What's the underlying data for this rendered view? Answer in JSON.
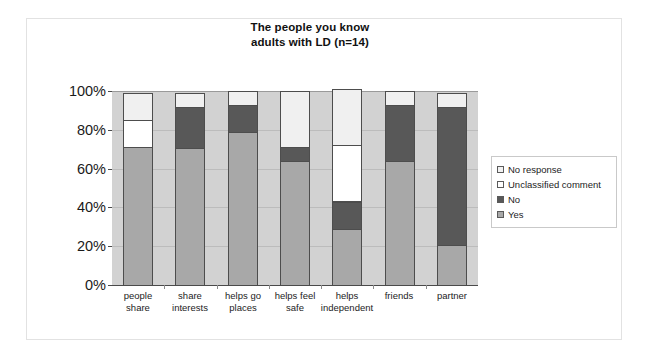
{
  "chart_data": {
    "type": "bar",
    "subtype": "stacked-100-percent",
    "title": "The people you know adults with LD (n=14)",
    "title_lines": [
      "The people you know",
      "adults with LD (n=14)"
    ],
    "xlabel": "",
    "ylabel": "",
    "ylim": [
      0,
      100
    ],
    "ytick_labels": [
      "0%",
      "20%",
      "40%",
      "60%",
      "80%",
      "100%"
    ],
    "ytick_values": [
      0,
      20,
      40,
      60,
      80,
      100
    ],
    "grid": true,
    "legend_position": "right",
    "categories": [
      "people share",
      "share interests",
      "helps go places",
      "helps feel safe",
      "helps independent",
      "friends",
      "partner"
    ],
    "category_lines": [
      [
        "people",
        "share"
      ],
      [
        "share",
        "interests"
      ],
      [
        "helps go",
        "places"
      ],
      [
        "helps feel",
        "safe"
      ],
      [
        "helps",
        "independent"
      ],
      [
        "friends",
        ""
      ],
      [
        "partner",
        ""
      ]
    ],
    "series": [
      {
        "name": "Yes",
        "color": "#a8a8a8",
        "values": [
          71,
          71,
          79,
          64,
          29,
          64,
          21
        ]
      },
      {
        "name": "No",
        "color": "#585858",
        "values": [
          0,
          21,
          14,
          7,
          14,
          29,
          71
        ]
      },
      {
        "name": "Unclassified comment",
        "color": "#ffffff",
        "values": [
          14,
          0,
          0,
          0,
          29,
          0,
          0
        ]
      },
      {
        "name": "No response",
        "color": "#f0f0f0",
        "values": [
          14,
          7,
          7,
          29,
          29,
          7,
          7
        ]
      }
    ]
  },
  "legend": {
    "items": [
      {
        "label": "No response",
        "swatch": "sw-nores"
      },
      {
        "label": "Unclassified comment",
        "swatch": "sw-unc"
      },
      {
        "label": "No",
        "swatch": "sw-no"
      },
      {
        "label": "Yes",
        "swatch": "sw-yes"
      }
    ]
  },
  "colors": {
    "plot_background": "#d2d2d2",
    "gridline": "#bcbcbc",
    "axis": "#4a4a4a",
    "bar_border": "#4d4d4d",
    "figure_border": "#e2e2e2"
  }
}
